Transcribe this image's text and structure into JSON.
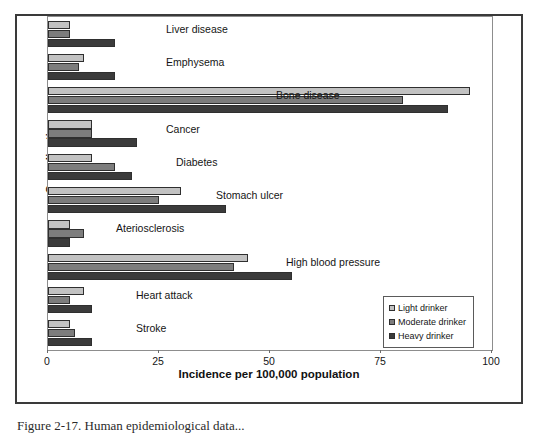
{
  "figure": {
    "y_axis_title": "Complication",
    "x_axis_title": "Incidence per 100,000 population",
    "caption": "Figure 2-17. Human epidemiological data..."
  },
  "legend": {
    "items": [
      {
        "label": "Light drinker",
        "key": "light",
        "color": "#c2c2c2"
      },
      {
        "label": "Moderate drinker",
        "key": "moderate",
        "color": "#7d7d7d"
      },
      {
        "label": "Heavy drinker",
        "key": "heavy",
        "color": "#3b3b3b"
      }
    ]
  },
  "axis": {
    "ticks": [
      "0",
      "25",
      "50",
      "75",
      "100"
    ]
  },
  "chart_data": {
    "type": "bar",
    "orientation": "horizontal",
    "title": "",
    "xlabel": "Incidence per 100,000 population",
    "ylabel": "Complication",
    "xlim": [
      0,
      100
    ],
    "xticks": [
      0,
      25,
      50,
      75,
      100
    ],
    "grid": false,
    "legend_position": "bottom-right",
    "categories": [
      "Liver disease",
      "Emphysema",
      "Bone disease",
      "Cancer",
      "Diabetes",
      "Stomach ulcer",
      "Ateriosclerosis",
      "High blood pressure",
      "Heart attack",
      "Stroke"
    ],
    "series": [
      {
        "name": "Light drinker",
        "color": "#c2c2c2",
        "values": [
          5,
          8,
          95,
          10,
          10,
          30,
          5,
          45,
          8,
          5
        ]
      },
      {
        "name": "Moderate drinker",
        "color": "#7d7d7d",
        "values": [
          5,
          7,
          80,
          10,
          15,
          25,
          8,
          42,
          5,
          6
        ]
      },
      {
        "name": "Heavy drinker",
        "color": "#3b3b3b",
        "values": [
          15,
          15,
          90,
          20,
          19,
          40,
          5,
          55,
          10,
          10
        ]
      }
    ]
  }
}
